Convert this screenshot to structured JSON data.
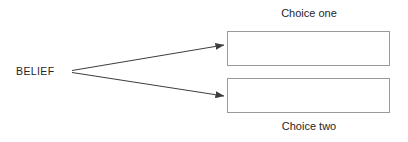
{
  "diagram": {
    "type": "branching-decision",
    "background_color": "#ffffff",
    "source": {
      "label": "BELIEF",
      "text_color": "#262626"
    },
    "connectors": [
      {
        "name": "arrow-to-choice-one",
        "from": "BELIEF",
        "to": "Choice one",
        "style": "solid-line-with-filled-arrowhead",
        "color": "#3d3d3d"
      },
      {
        "name": "arrow-to-choice-two",
        "from": "BELIEF",
        "to": "Choice two",
        "style": "solid-line-with-filled-arrowhead",
        "color": "#3d3d3d"
      }
    ],
    "choices": [
      {
        "caption": "Choice one",
        "caption_position": "above",
        "box_text": "",
        "border_color": "#9a9a9a",
        "fill_color": "#ffffff"
      },
      {
        "caption": "Choice two",
        "caption_position": "below",
        "box_text": "",
        "border_color": "#9a9a9a",
        "fill_color": "#ffffff"
      }
    ]
  }
}
